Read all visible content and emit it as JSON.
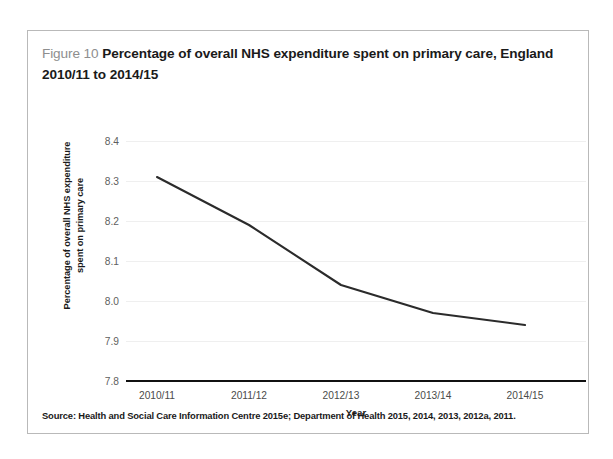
{
  "figure": {
    "number_label": "Figure 10",
    "title": "Percentage of overall NHS expenditure spent on primary care, England 2010/11 to 2014/15",
    "source_note": "Source: Health and Social Care Information Centre 2015e; Department of Health 2015, 2014, 2013, 2012a, 2011."
  },
  "chart_data": {
    "type": "line",
    "title": "Percentage of overall NHS expenditure spent on primary care, England 2010/11 to 2014/15",
    "xlabel": "Year",
    "ylabel": "Percentage of overall NHS expenditure spent on primary care",
    "ylabel_line1": "Percentage of overall NHS expenditure",
    "ylabel_line2": "spent on primary care",
    "categories": [
      "2010/11",
      "2011/12",
      "2012/13",
      "2013/14",
      "2014/15"
    ],
    "values": [
      8.31,
      8.19,
      8.04,
      7.97,
      7.94
    ],
    "series": [
      {
        "name": "Percentage of overall NHS expenditure spent on primary care",
        "values": [
          8.31,
          8.19,
          8.04,
          7.97,
          7.94
        ],
        "color": "#2b2b2b"
      }
    ],
    "ylim": [
      7.8,
      8.4
    ],
    "ytick_labels": [
      "8.4",
      "8.3",
      "8.2",
      "8.1",
      "8.0",
      "7.9",
      "7.8"
    ],
    "ytick_values": [
      8.4,
      8.3,
      8.2,
      8.1,
      8.0,
      7.9,
      7.8
    ],
    "grid": true,
    "gridline_color": "#efefef",
    "legend": "none",
    "axis_color": "#111111"
  }
}
